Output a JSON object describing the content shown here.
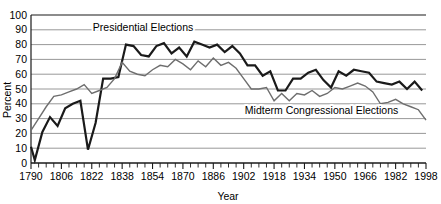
{
  "chart_data": {
    "type": "line",
    "title": "",
    "xlabel": "Year",
    "ylabel": "Percent",
    "ylim": [
      0,
      100
    ],
    "ytick_step": 10,
    "yticks": [
      "0",
      "10",
      "20",
      "30",
      "40",
      "50",
      "60",
      "70",
      "80",
      "90",
      "100"
    ],
    "xlim": [
      1790,
      1998
    ],
    "xtick_step": 4,
    "xticks": [
      "1790",
      "1806",
      "1822",
      "1838",
      "1854",
      "1870",
      "1886",
      "1902",
      "1918",
      "1934",
      "1950",
      "1966",
      "1982",
      "1998"
    ],
    "xtick_label_step": 16,
    "grid": true,
    "grid_axis": "y",
    "legend_position": "inline-annotation",
    "annotations": [
      {
        "text": "Presidential Elections",
        "x": 1849,
        "y": 89
      },
      {
        "text": "Midterm Congressional Elections",
        "x": 1943,
        "y": 33
      }
    ],
    "series": [
      {
        "name": "Presidential Elections",
        "color": "#1a1a1a",
        "width": 2.2,
        "x": [
          1790,
          1792,
          1796,
          1800,
          1804,
          1808,
          1812,
          1816,
          1820,
          1824,
          1828,
          1832,
          1836,
          1840,
          1844,
          1848,
          1852,
          1856,
          1860,
          1864,
          1868,
          1872,
          1876,
          1880,
          1884,
          1888,
          1892,
          1896,
          1900,
          1904,
          1908,
          1912,
          1916,
          1920,
          1924,
          1928,
          1932,
          1936,
          1940,
          1944,
          1948,
          1952,
          1956,
          1960,
          1964,
          1968,
          1972,
          1976,
          1980,
          1984,
          1988,
          1992,
          1996
        ],
        "values": [
          11,
          2,
          21,
          31,
          25,
          37,
          40,
          42,
          9,
          27,
          57,
          57,
          58,
          80,
          79,
          73,
          72,
          79,
          81,
          74,
          78,
          72,
          82,
          80,
          78,
          80,
          75,
          79,
          74,
          66,
          66,
          59,
          62,
          49,
          49,
          57,
          57,
          61,
          63,
          56,
          51,
          62,
          59,
          63,
          62,
          61,
          55,
          54,
          53,
          55,
          50,
          55,
          49
        ],
        "annotation": "Presidential Elections"
      },
      {
        "name": "Midterm Congressional Elections",
        "color": "#6e6e6e",
        "width": 1.4,
        "x": [
          1790,
          1794,
          1798,
          1802,
          1806,
          1810,
          1814,
          1818,
          1822,
          1826,
          1830,
          1834,
          1838,
          1842,
          1846,
          1850,
          1854,
          1858,
          1862,
          1866,
          1870,
          1874,
          1878,
          1882,
          1886,
          1890,
          1894,
          1898,
          1902,
          1906,
          1910,
          1914,
          1918,
          1922,
          1926,
          1930,
          1934,
          1938,
          1942,
          1946,
          1950,
          1954,
          1958,
          1962,
          1966,
          1970,
          1974,
          1978,
          1982,
          1986,
          1990,
          1994,
          1998
        ],
        "values": [
          22,
          30,
          38,
          45,
          46,
          48,
          50,
          53,
          47,
          49,
          51,
          57,
          68,
          62,
          60,
          59,
          63,
          66,
          65,
          70,
          67,
          63,
          69,
          65,
          71,
          66,
          68,
          64,
          57,
          50,
          50,
          51,
          42,
          47,
          42,
          47,
          46,
          49,
          45,
          47,
          51,
          50,
          52,
          54,
          52,
          48,
          40,
          41,
          43,
          40,
          38,
          36,
          29
        ],
        "annotation": "Midterm Congressional Elections"
      }
    ]
  },
  "axis": {
    "y_title": "Percent",
    "x_title": "Year"
  },
  "colors": {
    "grid": "#8c8c8c",
    "axis": "#1a1a1a",
    "presidential": "#1a1a1a",
    "midterm": "#6e6e6e",
    "background": "#ffffff"
  }
}
